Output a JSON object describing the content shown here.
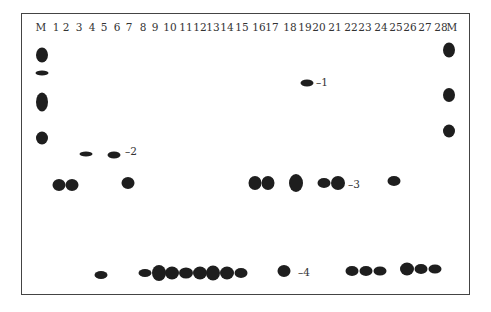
{
  "figure": {
    "lane_labels": [
      "M",
      "1",
      "2",
      "3",
      "4",
      "5",
      "6",
      "7",
      "8",
      "9",
      "10",
      "11",
      "12",
      "13",
      "14",
      "15",
      "16",
      "17",
      "18",
      "19",
      "20",
      "21",
      "22",
      "23",
      "24",
      "25",
      "26",
      "27",
      "28",
      "M"
    ],
    "lane_x": [
      41,
      56,
      66,
      79,
      92,
      104,
      117,
      129,
      143,
      155,
      170,
      186,
      200,
      213,
      227,
      242,
      259,
      272,
      290,
      305,
      319,
      335,
      351,
      365,
      381,
      396,
      410,
      425,
      441,
      452
    ],
    "band_labels": [
      {
        "text": "–1",
        "x": 316,
        "y": 82
      },
      {
        "text": "–2",
        "x": 125,
        "y": 151
      },
      {
        "text": "–3",
        "x": 348,
        "y": 184
      },
      {
        "text": "–4",
        "x": 298,
        "y": 272
      }
    ],
    "spots": [
      {
        "lane": "M-left",
        "x": 42,
        "y": 55,
        "w": 12,
        "h": 15
      },
      {
        "lane": "M-left",
        "x": 42,
        "y": 73,
        "w": 13,
        "h": 5
      },
      {
        "lane": "M-left",
        "x": 42,
        "y": 102,
        "w": 12,
        "h": 19
      },
      {
        "lane": "M-left",
        "x": 42,
        "y": 138,
        "w": 12,
        "h": 13
      },
      {
        "lane": "4",
        "x": 86,
        "y": 154,
        "w": 13,
        "h": 5
      },
      {
        "lane": "6",
        "x": 114,
        "y": 155,
        "w": 13,
        "h": 7
      },
      {
        "lane": "1",
        "x": 59,
        "y": 185,
        "w": 13,
        "h": 12
      },
      {
        "lane": "2",
        "x": 72,
        "y": 185,
        "w": 13,
        "h": 12
      },
      {
        "lane": "7",
        "x": 128,
        "y": 183,
        "w": 13,
        "h": 12
      },
      {
        "lane": "5",
        "x": 101,
        "y": 275,
        "w": 13,
        "h": 8
      },
      {
        "lane": "8",
        "x": 145,
        "y": 273,
        "w": 13,
        "h": 8
      },
      {
        "lane": "9",
        "x": 159,
        "y": 273,
        "w": 14,
        "h": 16
      },
      {
        "lane": "10",
        "x": 172,
        "y": 273,
        "w": 14,
        "h": 13
      },
      {
        "lane": "11",
        "x": 186,
        "y": 273,
        "w": 14,
        "h": 11
      },
      {
        "lane": "12",
        "x": 200,
        "y": 273,
        "w": 14,
        "h": 13
      },
      {
        "lane": "13",
        "x": 213,
        "y": 273,
        "w": 14,
        "h": 15
      },
      {
        "lane": "14",
        "x": 227,
        "y": 273,
        "w": 14,
        "h": 13
      },
      {
        "lane": "15",
        "x": 241,
        "y": 273,
        "w": 13,
        "h": 10
      },
      {
        "lane": "16",
        "x": 255,
        "y": 183,
        "w": 13,
        "h": 14
      },
      {
        "lane": "17",
        "x": 268,
        "y": 183,
        "w": 13,
        "h": 14
      },
      {
        "lane": "18",
        "x": 296,
        "y": 183,
        "w": 14,
        "h": 18
      },
      {
        "lane": "18",
        "x": 284,
        "y": 271,
        "w": 13,
        "h": 12
      },
      {
        "lane": "19",
        "x": 307,
        "y": 83,
        "w": 13,
        "h": 7
      },
      {
        "lane": "20",
        "x": 324,
        "y": 183,
        "w": 13,
        "h": 10
      },
      {
        "lane": "21",
        "x": 338,
        "y": 183,
        "w": 14,
        "h": 14
      },
      {
        "lane": "22",
        "x": 352,
        "y": 271,
        "w": 13,
        "h": 10
      },
      {
        "lane": "23",
        "x": 366,
        "y": 271,
        "w": 13,
        "h": 10
      },
      {
        "lane": "24",
        "x": 380,
        "y": 271,
        "w": 13,
        "h": 9
      },
      {
        "lane": "25",
        "x": 394,
        "y": 181,
        "w": 13,
        "h": 10
      },
      {
        "lane": "26",
        "x": 407,
        "y": 269,
        "w": 14,
        "h": 13
      },
      {
        "lane": "27",
        "x": 421,
        "y": 269,
        "w": 13,
        "h": 10
      },
      {
        "lane": "28",
        "x": 435,
        "y": 269,
        "w": 13,
        "h": 9
      },
      {
        "lane": "M-right",
        "x": 449,
        "y": 50,
        "w": 12,
        "h": 15
      },
      {
        "lane": "M-right",
        "x": 449,
        "y": 95,
        "w": 12,
        "h": 14
      },
      {
        "lane": "M-right",
        "x": 449,
        "y": 131,
        "w": 12,
        "h": 13
      }
    ],
    "colors": {
      "spot": "#1e1e1e",
      "frame": "#444444",
      "text": "#333333"
    }
  }
}
